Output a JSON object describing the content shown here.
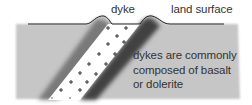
{
  "diagram": {
    "labels": {
      "dyke": "dyke",
      "land_surface": "land surface",
      "description": [
        "dykes are commonly",
        "composed of basalt",
        "or dolerite"
      ]
    },
    "colors": {
      "country_rock": "#c4c4c4",
      "dyke_fill": "#ffffff",
      "contact_zone": "#3a3a3a",
      "surface_line": "#222222",
      "text": "#333333"
    },
    "elements": [
      {
        "id": "country-rock",
        "type": "region",
        "label": "surrounding rock"
      },
      {
        "id": "land-surface",
        "type": "line",
        "label": "land surface"
      },
      {
        "id": "dyke",
        "type": "intrusion",
        "label": "dyke",
        "pattern": "plus-crosses"
      }
    ]
  }
}
